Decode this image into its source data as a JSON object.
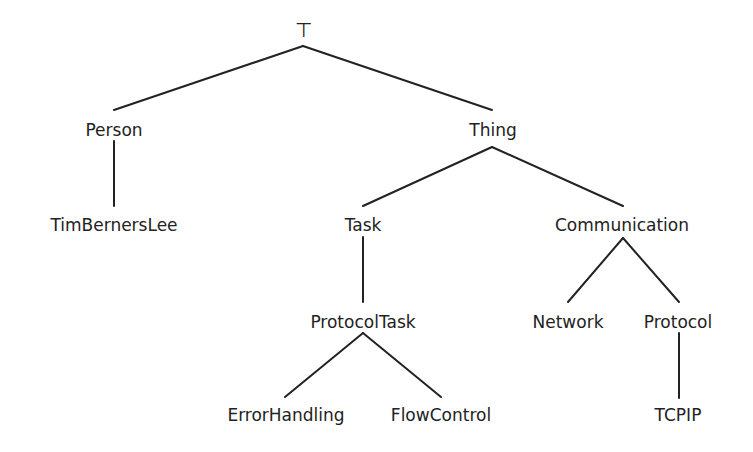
{
  "diagram": {
    "type": "tree",
    "root": "⊤",
    "nodes": [
      {
        "id": "top",
        "label": "⊤",
        "x": 303,
        "y": 30
      },
      {
        "id": "person",
        "label": "Person",
        "x": 114,
        "y": 130
      },
      {
        "id": "thing",
        "label": "Thing",
        "x": 493,
        "y": 130
      },
      {
        "id": "timbernerslee",
        "label": "TimBernersLee",
        "x": 114,
        "y": 225
      },
      {
        "id": "task",
        "label": "Task",
        "x": 363,
        "y": 225
      },
      {
        "id": "communication",
        "label": "Communication",
        "x": 622,
        "y": 225
      },
      {
        "id": "protocoltask",
        "label": "ProtocolTask",
        "x": 363,
        "y": 322
      },
      {
        "id": "network",
        "label": "Network",
        "x": 568,
        "y": 322
      },
      {
        "id": "protocol",
        "label": "Protocol",
        "x": 678,
        "y": 322
      },
      {
        "id": "errorhandling",
        "label": "ErrorHandling",
        "x": 286,
        "y": 415
      },
      {
        "id": "flowcontrol",
        "label": "FlowControl",
        "x": 441,
        "y": 415
      },
      {
        "id": "tcpip",
        "label": "TCPIP",
        "x": 678,
        "y": 415
      }
    ],
    "edges": [
      {
        "from": "top",
        "to": "person"
      },
      {
        "from": "top",
        "to": "thing"
      },
      {
        "from": "person",
        "to": "timbernerslee"
      },
      {
        "from": "thing",
        "to": "task"
      },
      {
        "from": "thing",
        "to": "communication"
      },
      {
        "from": "task",
        "to": "protocoltask"
      },
      {
        "from": "communication",
        "to": "network"
      },
      {
        "from": "communication",
        "to": "protocol"
      },
      {
        "from": "protocoltask",
        "to": "errorhandling"
      },
      {
        "from": "protocoltask",
        "to": "flowcontrol"
      },
      {
        "from": "protocol",
        "to": "tcpip"
      }
    ],
    "line_color": "#222222"
  }
}
